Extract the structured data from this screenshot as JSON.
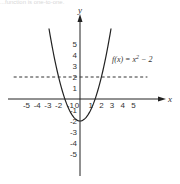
{
  "page": {
    "cut_off_text": "...function is one-to-one."
  },
  "chart_data": {
    "type": "line",
    "title": "",
    "xlabel": "x",
    "ylabel": "y",
    "xlim": [
      -6.5,
      7.5
    ],
    "ylim": [
      -7,
      7.8
    ],
    "x_ticks": [
      -5,
      -4,
      -3,
      -2,
      -1,
      0,
      1,
      2,
      3,
      4,
      5
    ],
    "x_tick_labels": [
      "-5",
      "-4",
      "-3",
      "-2",
      "-1",
      "0",
      "1",
      "2",
      "3",
      "4",
      "5"
    ],
    "y_ticks": [
      5,
      4,
      3,
      2,
      1,
      -1,
      -2,
      -3,
      -4,
      -5
    ],
    "y_tick_labels": [
      "5",
      "4",
      "3",
      "2",
      "1",
      "-1",
      "-2",
      "-3",
      "-4",
      "-5"
    ],
    "grid": false,
    "series": [
      {
        "name": "f(x) = x^2 - 2",
        "style": "solid",
        "x": [
          -2.9,
          -2.5,
          -2,
          -1.5,
          -1,
          -0.5,
          0,
          0.5,
          1,
          1.5,
          2,
          2.5,
          2.9
        ],
        "values": [
          6.41,
          4.25,
          2,
          0.25,
          -1,
          -1.75,
          -2,
          -1.75,
          -1,
          0.25,
          2,
          4.25,
          6.41
        ]
      },
      {
        "name": "y = 2 (horizontal line test)",
        "style": "dashed",
        "x": [
          -6.2,
          6.3
        ],
        "values": [
          2,
          2
        ]
      }
    ],
    "annotations": [
      {
        "text": "f(x) = x",
        "superscript": "2",
        "suffix": " − 2",
        "x": 2.5,
        "y": 3.8
      }
    ]
  }
}
